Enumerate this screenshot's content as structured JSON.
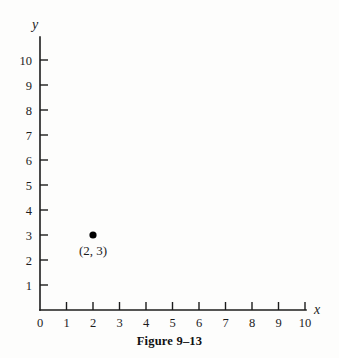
{
  "figure": {
    "caption": "Figure 9–13",
    "caption_top_px": 334
  },
  "chart_data": {
    "type": "scatter",
    "title": "",
    "xlabel": "x",
    "ylabel": "y",
    "xlim": [
      0,
      11
    ],
    "ylim": [
      0,
      10.8
    ],
    "grid": false,
    "legend": null,
    "x_ticks": [
      0,
      1,
      2,
      3,
      4,
      5,
      6,
      7,
      8,
      9,
      10
    ],
    "y_ticks": [
      1,
      2,
      3,
      4,
      5,
      6,
      7,
      8,
      9,
      10
    ],
    "x_tick_labels": [
      "0",
      "1",
      "2",
      "3",
      "4",
      "5",
      "6",
      "7",
      "8",
      "9",
      "10"
    ],
    "y_tick_labels": [
      "1",
      "2",
      "3",
      "4",
      "5",
      "6",
      "7",
      "8",
      "9",
      "10"
    ],
    "points": [
      {
        "x": 2,
        "y": 3,
        "label": "(2, 3)",
        "color": "#000000"
      }
    ],
    "series": [
      {
        "name": "plotted-point",
        "x": [
          2
        ],
        "y": [
          3
        ]
      }
    ]
  },
  "geometry": {
    "origin_x": 40,
    "origin_y": 310,
    "x_step": 26.5,
    "y_step": 25,
    "x_axis_end": 306,
    "y_axis_top": 37,
    "tick_len": 8,
    "dot_radius": 3.6
  },
  "labels": {
    "x_axis_name": "x",
    "y_axis_name": "y"
  },
  "colors": {
    "ink": "#1c1c1c",
    "paper": "#fdfdfc",
    "point": "#000000"
  }
}
